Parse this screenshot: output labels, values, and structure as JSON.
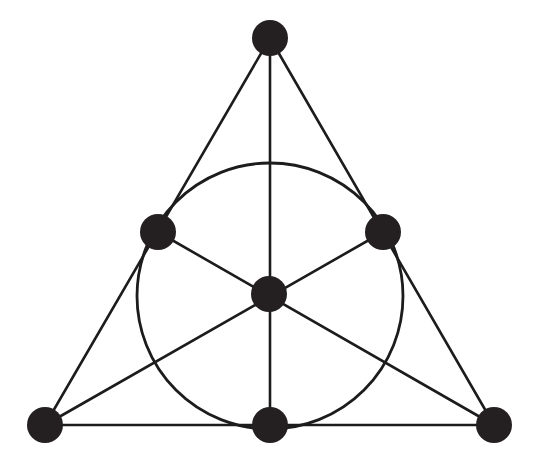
{
  "figure": {
    "canvas": {
      "width": 539,
      "height": 466,
      "background": "#ffffff"
    },
    "style": {
      "node_color": "#241f20",
      "line_color": "#1c1c1c",
      "line_width": 2.6,
      "circle_width": 2.8,
      "node_radius": 17.5
    },
    "counts": {
      "points": 7,
      "lines": 7,
      "points_per_line": 3,
      "lines_per_point": 3
    }
  },
  "chart_data": {
    "type": "diagram",
    "xlabel": "",
    "ylabel": "",
    "xlim": [
      0,
      539
    ],
    "ylim": [
      0,
      466
    ],
    "grid": false,
    "legend": "none",
    "nodes": [
      {
        "id": "apex",
        "label": "top vertex",
        "x": 270,
        "y": 38,
        "r": 18
      },
      {
        "id": "mid-left",
        "label": "left side midpoint",
        "x": 158,
        "y": 232,
        "r": 18
      },
      {
        "id": "mid-right",
        "label": "right side midpoint",
        "x": 383,
        "y": 232,
        "r": 18
      },
      {
        "id": "center",
        "label": "centroid",
        "x": 269,
        "y": 294,
        "r": 18
      },
      {
        "id": "bottom-left",
        "label": "bottom-left vertex",
        "x": 45,
        "y": 425,
        "r": 18
      },
      {
        "id": "bottom-mid",
        "label": "base midpoint",
        "x": 270,
        "y": 425,
        "r": 18
      },
      {
        "id": "bottom-right",
        "label": "bottom-right vertex",
        "x": 494,
        "y": 425,
        "r": 18
      }
    ],
    "edges": [
      {
        "id": "line-left-side",
        "label": "apex - mid-left - bottom-left",
        "kind": "segment",
        "points": [
          "apex",
          "mid-left",
          "bottom-left"
        ],
        "x1": 270,
        "y1": 38,
        "x2": 45,
        "y2": 425
      },
      {
        "id": "line-right-side",
        "label": "apex - mid-right - bottom-right",
        "kind": "segment",
        "points": [
          "apex",
          "mid-right",
          "bottom-right"
        ],
        "x1": 270,
        "y1": 38,
        "x2": 494,
        "y2": 425
      },
      {
        "id": "line-base",
        "label": "bottom-left - bottom-mid - bottom-right",
        "kind": "segment",
        "points": [
          "bottom-left",
          "bottom-mid",
          "bottom-right"
        ],
        "x1": 45,
        "y1": 425,
        "x2": 494,
        "y2": 425
      },
      {
        "id": "line-vertical",
        "label": "apex - center - bottom-mid",
        "kind": "segment",
        "points": [
          "apex",
          "center",
          "bottom-mid"
        ],
        "x1": 270,
        "y1": 38,
        "x2": 270,
        "y2": 425
      },
      {
        "id": "line-median-left",
        "label": "mid-left - center - bottom-right",
        "kind": "segment",
        "points": [
          "mid-left",
          "center",
          "bottom-right"
        ],
        "x1": 158,
        "y1": 232,
        "x2": 494,
        "y2": 425
      },
      {
        "id": "line-median-right",
        "label": "mid-right - center - bottom-left",
        "kind": "segment",
        "points": [
          "mid-right",
          "center",
          "bottom-left"
        ],
        "x1": 383,
        "y1": 232,
        "x2": 45,
        "y2": 425
      },
      {
        "id": "line-incircle",
        "label": "mid-left - mid-right - bottom-mid",
        "kind": "circle",
        "points": [
          "mid-left",
          "mid-right",
          "bottom-mid"
        ],
        "cx": 270,
        "cy": 296,
        "r": 133
      }
    ]
  }
}
